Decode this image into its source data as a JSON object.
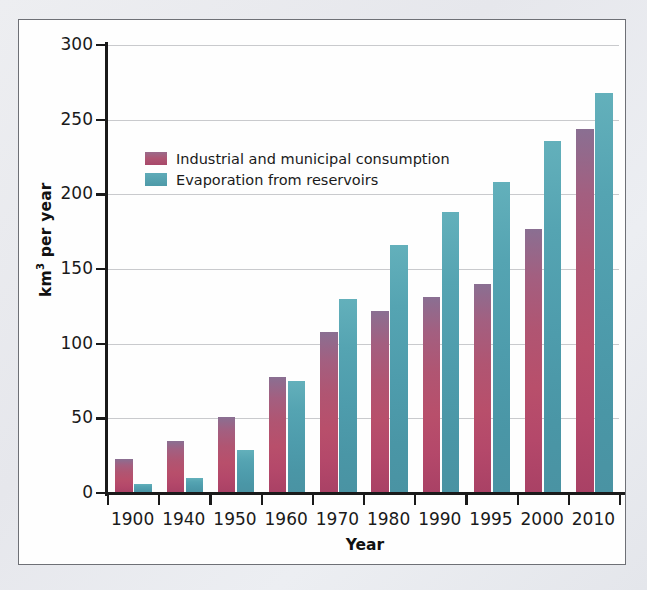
{
  "chart_data": {
    "type": "bar",
    "title": "",
    "xlabel": "Year",
    "ylabel": "km³ per year",
    "categories": [
      "1900",
      "1940",
      "1950",
      "1960",
      "1970",
      "1980",
      "1990",
      "1995",
      "2000",
      "2010"
    ],
    "series": [
      {
        "name": "Industrial and municipal consumption",
        "color": "#b04f6d",
        "values": [
          23,
          35,
          51,
          78,
          108,
          122,
          131,
          140,
          177,
          244
        ]
      },
      {
        "name": "Evaporation from reservoirs",
        "color": "#4e9aa8",
        "values": [
          6,
          10,
          29,
          75,
          130,
          166,
          188,
          208,
          236,
          268
        ]
      }
    ],
    "ylim": [
      0,
      300
    ],
    "yticks": [
      0,
      50,
      100,
      150,
      200,
      250,
      300
    ],
    "ytick_labels": [
      "0",
      "50",
      "100",
      "150",
      "200",
      "250",
      "300"
    ],
    "grid": true,
    "legend_position": "upper-left-inside"
  },
  "panel": {
    "background_color": "#fefefe",
    "border_color": "#6e7076"
  },
  "page": {
    "background_color": "#e9eaee"
  }
}
